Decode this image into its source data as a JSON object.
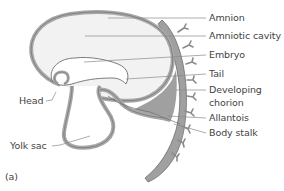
{
  "figure": {
    "panel_label": "(a)",
    "colors": {
      "membrane_gray": "#a8a8a8",
      "membrane_outline": "#6e6e6e",
      "chorion_fill": "#a0a0a0",
      "cavity_fill": "#f2f2f2",
      "leader_line": "#8a8a8a",
      "text": "#444444"
    },
    "labels": [
      {
        "id": "amnion",
        "text": "Amnion"
      },
      {
        "id": "amniotic-cavity",
        "text": "Amniotic cavity"
      },
      {
        "id": "embryo",
        "text": "Embryo"
      },
      {
        "id": "tail",
        "text": "Tail"
      },
      {
        "id": "developing-chorion-line1",
        "text": "Developing"
      },
      {
        "id": "developing-chorion-line2",
        "text": "chorion"
      },
      {
        "id": "allantois",
        "text": "Allantois"
      },
      {
        "id": "body-stalk",
        "text": "Body stalk"
      },
      {
        "id": "head",
        "text": "Head"
      },
      {
        "id": "yolk-sac",
        "text": "Yolk sac"
      }
    ]
  }
}
